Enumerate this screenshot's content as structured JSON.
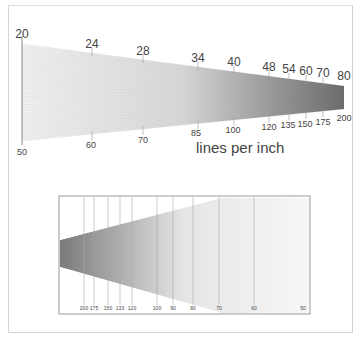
{
  "top_scale": {
    "upper_labels": [
      "20",
      "24",
      "28",
      "34",
      "40",
      "48",
      "54",
      "60",
      "70",
      "80"
    ],
    "lower_labels": [
      "50",
      "60",
      "70",
      "85",
      "100",
      "120",
      "135",
      "150",
      "175",
      "200"
    ],
    "unit_label": "lines per inch"
  },
  "bottom_scale": {
    "labels": [
      "200",
      "175",
      "150",
      "133",
      "120",
      "100",
      "90",
      "80",
      "70",
      "60",
      "50"
    ]
  },
  "colors": {
    "ink": "#444444",
    "grid": "#9a9a9a",
    "frame": "#d0d0d0"
  }
}
